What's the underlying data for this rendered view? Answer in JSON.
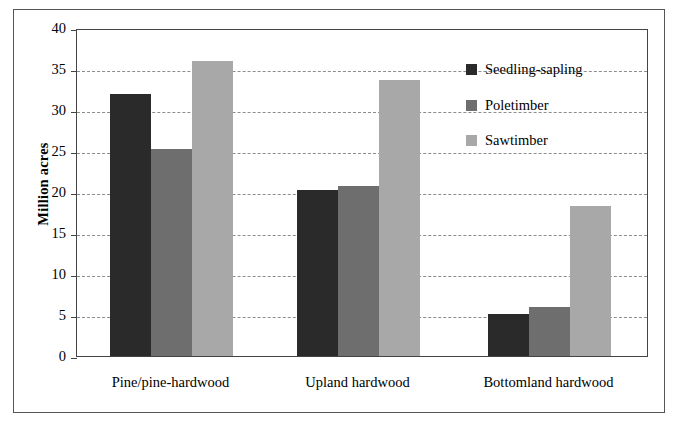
{
  "chart_data": {
    "type": "bar",
    "title": "",
    "subtitle": "",
    "xlabel": "",
    "ylabel": "Million acres",
    "ylim": [
      0,
      40
    ],
    "yticks": [
      "0",
      "5",
      "10",
      "15",
      "20",
      "25",
      "30",
      "35",
      "40"
    ],
    "ytick_values": [
      0,
      5,
      10,
      15,
      20,
      25,
      30,
      35,
      40
    ],
    "grid": true,
    "legend_position": "upper right",
    "categories": [
      "Pine/pine-hardwood",
      "Upland hardwood",
      "Bottomland hardwood"
    ],
    "series": [
      {
        "name": "Seedling-sapling",
        "color": "#2a2a2a",
        "values": [
          31.9,
          20.2,
          5.1
        ]
      },
      {
        "name": "Poletimber",
        "color": "#6e6e6e",
        "values": [
          25.3,
          20.7,
          6.0
        ]
      },
      {
        "name": "Sawtimber",
        "color": "#a8a8a8",
        "values": [
          36.0,
          33.6,
          18.3
        ]
      }
    ]
  },
  "axis": {
    "y_title": "Million acres"
  },
  "legend": {
    "entries": [
      {
        "label": "Seedling-sapling",
        "color": "#2a2a2a"
      },
      {
        "label": "Poletimber",
        "color": "#6e6e6e"
      },
      {
        "label": "Sawtimber",
        "color": "#a8a8a8"
      }
    ]
  },
  "colors": {
    "seedling_sapling": "#2a2a2a",
    "poletimber": "#6e6e6e",
    "sawtimber": "#a8a8a8",
    "gridline": "#8d8d8d",
    "frame": "#444444",
    "outer_border": "#555555"
  }
}
